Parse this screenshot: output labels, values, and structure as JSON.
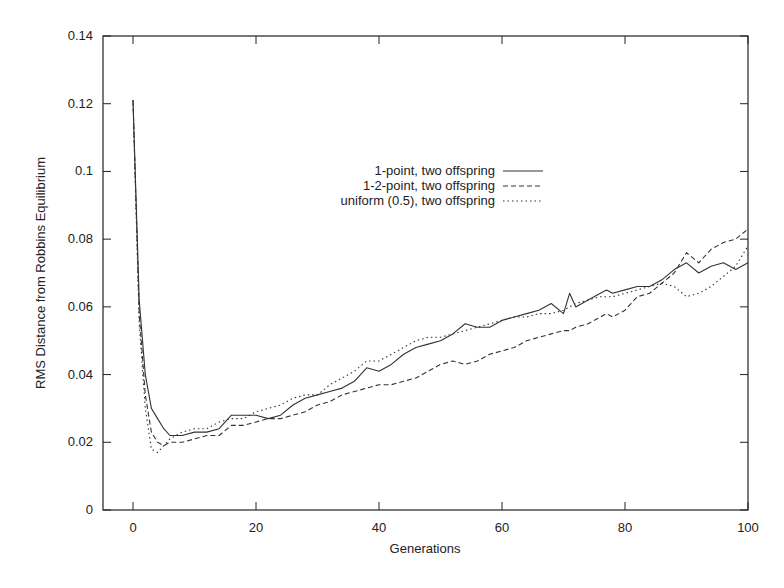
{
  "chart_data": {
    "type": "line",
    "title": "",
    "xlabel": "Generations",
    "ylabel": "RMS Distance from Robbins Equilibrium",
    "xlim": [
      -5,
      100
    ],
    "ylim": [
      0,
      0.14
    ],
    "xticks": [
      "0",
      "20",
      "40",
      "60",
      "80",
      "100"
    ],
    "xtick_values": [
      0,
      20,
      40,
      60,
      80,
      100
    ],
    "yticks": [
      "0",
      "0.02",
      "0.04",
      "0.06",
      "0.08",
      "0.1",
      "0.12",
      "0.14"
    ],
    "ytick_values": [
      0,
      0.02,
      0.04,
      0.06,
      0.08,
      0.1,
      0.12,
      0.14
    ],
    "grid": false,
    "legend_position": "upper center-right",
    "x": [
      0,
      1,
      2,
      3,
      4,
      5,
      6,
      7,
      8,
      10,
      12,
      14,
      16,
      18,
      20,
      22,
      24,
      26,
      28,
      30,
      32,
      34,
      36,
      38,
      40,
      42,
      44,
      46,
      48,
      50,
      52,
      54,
      56,
      58,
      60,
      62,
      64,
      66,
      68,
      70,
      71,
      72,
      74,
      76,
      77,
      78,
      80,
      82,
      84,
      86,
      88,
      90,
      92,
      94,
      96,
      98,
      100
    ],
    "series": [
      {
        "name": "1-point, two offspring",
        "style": "solid",
        "values": [
          0.121,
          0.062,
          0.04,
          0.03,
          0.027,
          0.024,
          0.022,
          0.022,
          0.022,
          0.023,
          0.023,
          0.024,
          0.028,
          0.028,
          0.028,
          0.027,
          0.028,
          0.031,
          0.033,
          0.034,
          0.035,
          0.036,
          0.038,
          0.042,
          0.041,
          0.043,
          0.046,
          0.048,
          0.049,
          0.05,
          0.052,
          0.055,
          0.054,
          0.054,
          0.056,
          0.057,
          0.058,
          0.059,
          0.061,
          0.058,
          0.064,
          0.06,
          0.062,
          0.064,
          0.065,
          0.064,
          0.065,
          0.066,
          0.066,
          0.068,
          0.071,
          0.073,
          0.07,
          0.072,
          0.073,
          0.071,
          0.073
        ]
      },
      {
        "name": "1-2-point, two offspring",
        "style": "dashed",
        "values": [
          0.121,
          0.058,
          0.034,
          0.023,
          0.02,
          0.019,
          0.02,
          0.02,
          0.02,
          0.021,
          0.022,
          0.022,
          0.025,
          0.025,
          0.026,
          0.027,
          0.027,
          0.028,
          0.029,
          0.031,
          0.032,
          0.034,
          0.035,
          0.036,
          0.037,
          0.037,
          0.038,
          0.039,
          0.041,
          0.043,
          0.044,
          0.043,
          0.044,
          0.046,
          0.047,
          0.048,
          0.05,
          0.051,
          0.052,
          0.053,
          0.053,
          0.054,
          0.055,
          0.057,
          0.058,
          0.057,
          0.059,
          0.063,
          0.064,
          0.067,
          0.07,
          0.076,
          0.073,
          0.077,
          0.079,
          0.08,
          0.083
        ]
      },
      {
        "name": "uniform (0.5), two offspring",
        "style": "dotted",
        "values": [
          0.121,
          0.055,
          0.03,
          0.018,
          0.017,
          0.019,
          0.021,
          0.022,
          0.023,
          0.024,
          0.024,
          0.026,
          0.027,
          0.027,
          0.029,
          0.03,
          0.031,
          0.033,
          0.034,
          0.034,
          0.037,
          0.039,
          0.041,
          0.044,
          0.044,
          0.046,
          0.048,
          0.05,
          0.051,
          0.051,
          0.052,
          0.053,
          0.054,
          0.055,
          0.056,
          0.057,
          0.057,
          0.058,
          0.058,
          0.059,
          0.06,
          0.061,
          0.062,
          0.063,
          0.063,
          0.063,
          0.064,
          0.065,
          0.066,
          0.067,
          0.066,
          0.063,
          0.064,
          0.066,
          0.069,
          0.072,
          0.078
        ]
      }
    ]
  },
  "colors": {
    "axis": "#222222",
    "line": "#333333",
    "background": "#ffffff"
  }
}
